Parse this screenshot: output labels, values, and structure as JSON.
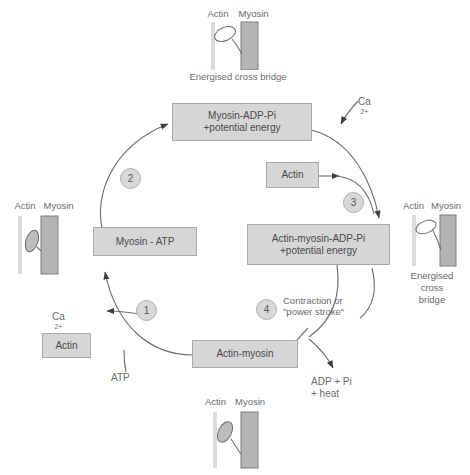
{
  "diagram": {
    "colors": {
      "box_fill": "#d6d6d6",
      "box_stroke": "#a9a9ab",
      "text": "#58585a",
      "arrow": "#4a4a4c",
      "actin_filament": "#d8d8d8",
      "myosin_filament": "#b4b4b4"
    },
    "boxes": [
      {
        "id": "myosin-adp-pi",
        "line1": "Myosin-ADP-Pi",
        "line2": "+potential energy"
      },
      {
        "id": "myosin-atp",
        "line1": "Myosin - ATP",
        "line2": ""
      },
      {
        "id": "actin",
        "line1": "Actin",
        "line2": ""
      },
      {
        "id": "actin-myosin-adp-pi",
        "line1": "Actin-myosin-ADP-Pi",
        "line2": "+potential energy"
      },
      {
        "id": "actin-myosin",
        "line1": "Actin-myosin",
        "line2": ""
      },
      {
        "id": "actin-left",
        "line1": "Actin",
        "line2": ""
      }
    ],
    "steps": [
      {
        "number": "1"
      },
      {
        "number": "2"
      },
      {
        "number": "3"
      },
      {
        "number": "4"
      }
    ],
    "labels": {
      "calcium_top": "Ca",
      "calcium_top_charge": "2+",
      "calcium_left": "Ca",
      "calcium_left_charge": "2+",
      "atp": "ATP",
      "adp_line1": "ADP + Pi",
      "adp_line2": "+ heat",
      "contraction_line1": "Contraction or",
      "contraction_line2": "\"power stroke\""
    },
    "illustrations": [
      {
        "id": "top",
        "actin_label": "Actin",
        "myosin_label": "Myosin",
        "caption": [
          "Energised cross bridge"
        ],
        "head_filled": false,
        "attached": true
      },
      {
        "id": "left",
        "actin_label": "Actin",
        "myosin_label": "Myosin",
        "caption": [],
        "head_filled": true,
        "attached": false
      },
      {
        "id": "right",
        "actin_label": "Actin",
        "myosin_label": "Myosin",
        "caption": [
          "Energised",
          "cross",
          "bridge"
        ],
        "head_filled": false,
        "attached": true
      },
      {
        "id": "bottom",
        "actin_label": "Actin",
        "myosin_label": "Myosin",
        "caption": [],
        "head_filled": true,
        "attached": true
      }
    ]
  }
}
